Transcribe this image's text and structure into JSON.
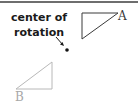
{
  "diagram": {
    "annotation": {
      "line1": "center of",
      "line2": "rotation"
    },
    "center_point": {
      "x": 67,
      "y": 50
    },
    "triangle_a": {
      "label": "A",
      "points": "82,13 118,13 82,39",
      "stroke": "#3a3a3a"
    },
    "triangle_b": {
      "label": "B",
      "points": "52,62 52,89 16,89",
      "stroke": "#b8b8b8"
    },
    "colors": {
      "text": "#1a1a1a",
      "label_a": "#3a3a3a",
      "label_b": "#a8a8a8",
      "border": "#6e6e6e"
    }
  }
}
